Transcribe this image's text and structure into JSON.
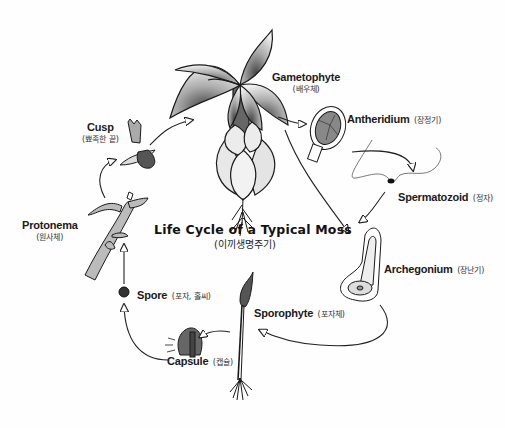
{
  "title": {
    "en": "Life Cycle of a Typical Moss",
    "ko": "(이끼생명주기)"
  },
  "stages": {
    "gametophyte": {
      "en": "Gametophyte",
      "ko": "(배우체)"
    },
    "antheridium": {
      "en": "Antheridium",
      "ko": "(장정기)"
    },
    "spermatozoid": {
      "en": "Spermatozoid",
      "ko": "(정자)"
    },
    "archegonium": {
      "en": "Archegonium",
      "ko": "(장난기)"
    },
    "sporophyte": {
      "en": "Sporophyte",
      "ko": "(포자체)"
    },
    "capsule": {
      "en": "Capsule",
      "ko": "(캡슐)"
    },
    "spore": {
      "en": "Spore",
      "ko": "(포자, 홀씨)"
    },
    "protonema": {
      "en": "Protonema",
      "ko": "(원사체)"
    },
    "cusp": {
      "en": "Cusp",
      "ko": "(뾰족한 끝)"
    }
  },
  "cycle_order": [
    "Protonema",
    "Cusp",
    "Gametophyte",
    "Antheridium",
    "Spermatozoid",
    "Archegonium",
    "Sporophyte",
    "Capsule",
    "Spore"
  ],
  "colors": {
    "ink": "#1a1a1a",
    "plant_light": "#d8d8d8",
    "plant_dark": "#555555",
    "background": "#fefefe"
  }
}
